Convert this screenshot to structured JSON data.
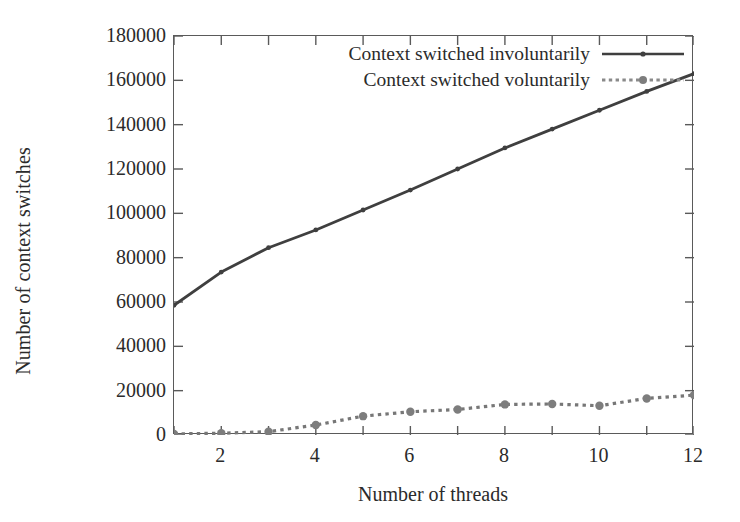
{
  "chart_data": {
    "type": "line",
    "title": "",
    "xlabel": "Number of threads",
    "ylabel": "Number of context switches",
    "xlim": [
      1,
      12
    ],
    "ylim": [
      0,
      180000
    ],
    "xticks": [
      2,
      4,
      6,
      8,
      10,
      12
    ],
    "xtick_labels": [
      "2",
      "4",
      "6",
      "8",
      "10",
      "12"
    ],
    "xminor_ticks": [
      1,
      3,
      5,
      7,
      9,
      11
    ],
    "yticks": [
      0,
      20000,
      40000,
      60000,
      80000,
      100000,
      120000,
      140000,
      160000,
      180000
    ],
    "ytick_labels": [
      "0",
      "20000",
      "40000",
      "60000",
      "80000",
      "100000",
      "120000",
      "140000",
      "160000",
      "180000"
    ],
    "grid": false,
    "legend_position": "top-right",
    "x": [
      1,
      2,
      3,
      4,
      5,
      6,
      7,
      8,
      9,
      10,
      11,
      12
    ],
    "series": [
      {
        "name": "Context switched involuntarily",
        "style": "solid",
        "color": "#3f3f3f",
        "marker": "point",
        "values": [
          58500,
          73500,
          84500,
          92500,
          101500,
          110500,
          120000,
          129500,
          138000,
          146500,
          155000,
          163000
        ]
      },
      {
        "name": "Context switched voluntarily",
        "style": "dotted",
        "color": "#777777",
        "marker": "point",
        "values": [
          500,
          800,
          1500,
          4500,
          8500,
          10500,
          11500,
          13800,
          14000,
          13200,
          16500,
          18000
        ]
      }
    ]
  },
  "legend": {
    "items": [
      {
        "label": "Context switched involuntarily"
      },
      {
        "label": "Context switched voluntarily"
      }
    ]
  },
  "axes": {
    "x_title": "Number of threads",
    "y_title": "Number of context switches"
  }
}
